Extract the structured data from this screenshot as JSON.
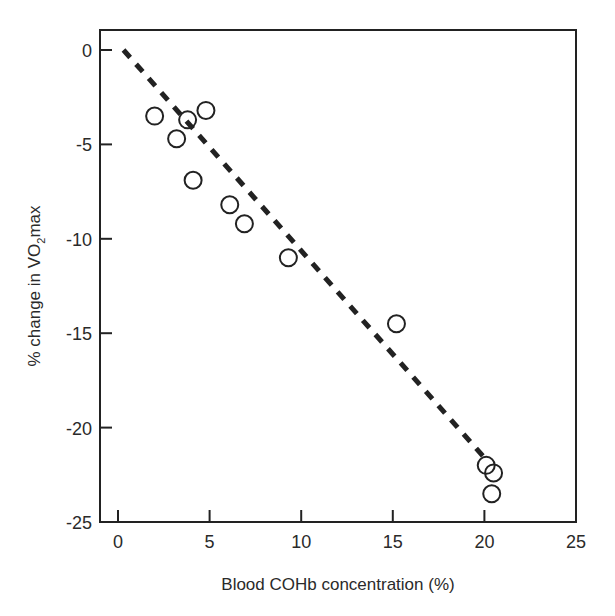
{
  "chart_data": {
    "type": "scatter",
    "title": "",
    "xlabel": "Blood COHb concentration (%)",
    "ylabel": "% change in V̇O₂max",
    "ylabel_parts": {
      "prefix": "% change in ",
      "v": "V",
      "o": "O",
      "sub": "2",
      "suffix": "max"
    },
    "xlim": [
      0,
      25
    ],
    "ylim": [
      -25,
      1
    ],
    "x_ticks": [
      0,
      5,
      10,
      15,
      20,
      25
    ],
    "y_ticks": [
      0,
      -5,
      -10,
      -15,
      -20,
      -25
    ],
    "x_tick_labels": [
      "0",
      "5",
      "10",
      "15",
      "20",
      "25"
    ],
    "y_tick_labels": [
      "0",
      "-5",
      "-10",
      "-15",
      "-20",
      "-25"
    ],
    "grid": false,
    "legend": null,
    "series": [
      {
        "name": "observations",
        "marker": "open-circle",
        "points": [
          {
            "x": 2.0,
            "y": -3.5
          },
          {
            "x": 3.2,
            "y": -4.7
          },
          {
            "x": 3.8,
            "y": -3.7
          },
          {
            "x": 4.8,
            "y": -3.2
          },
          {
            "x": 4.1,
            "y": -6.9
          },
          {
            "x": 6.1,
            "y": -8.2
          },
          {
            "x": 6.9,
            "y": -9.2
          },
          {
            "x": 9.3,
            "y": -11.0
          },
          {
            "x": 15.2,
            "y": -14.5
          },
          {
            "x": 20.1,
            "y": -22.0
          },
          {
            "x": 20.5,
            "y": -22.4
          },
          {
            "x": 20.4,
            "y": -23.5
          }
        ]
      },
      {
        "name": "regression line",
        "style": "dashed",
        "points": [
          {
            "x": 0.3,
            "y": 0.0
          },
          {
            "x": 20.1,
            "y": -21.7
          }
        ]
      }
    ],
    "colors": {
      "ink": "#222222",
      "background": "#ffffff"
    }
  }
}
